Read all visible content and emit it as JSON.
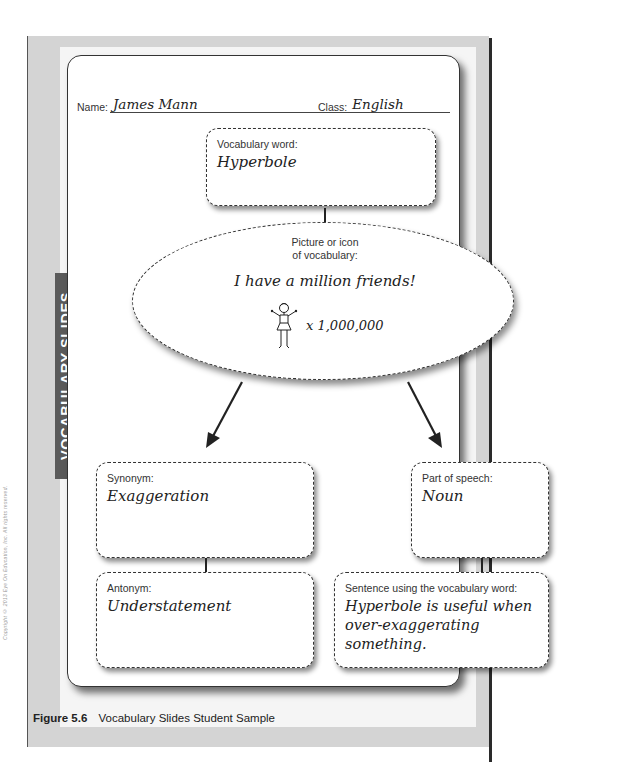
{
  "side_note": "Copyright © 2013 Eye On Education, Inc. All rights reserved.",
  "side_tab": {
    "label": "VOCABULARY SLIDES"
  },
  "header": {
    "name_label": "Name:",
    "name_value": "James Mann",
    "class_label": "Class:",
    "class_value": "English"
  },
  "vocabulary_word": {
    "caption": "Vocabulary word:",
    "value": "Hyperbole"
  },
  "picture": {
    "caption_line1": "Picture or icon",
    "caption_line2": "of vocabulary:",
    "text": "I have a million friends!",
    "icon": "stick-figure-icon",
    "multiplier": "x 1,000,000"
  },
  "synonym": {
    "caption": "Synonym:",
    "value": "Exaggeration"
  },
  "part_of_speech": {
    "caption": "Part of speech:",
    "value": "Noun"
  },
  "antonym": {
    "caption": "Antonym:",
    "value": "Understatement"
  },
  "sentence": {
    "caption": "Sentence using the vocabulary word:",
    "line1": "Hyperbole is useful when",
    "line2": "over-exaggerating something."
  },
  "figure_caption": {
    "number": "Figure 5.6",
    "title": "Vocabulary Slides Student Sample"
  },
  "colors": {
    "panel_gray": "#d4d4d4",
    "tab_gray": "#5a5a5a",
    "border": "#333333"
  }
}
